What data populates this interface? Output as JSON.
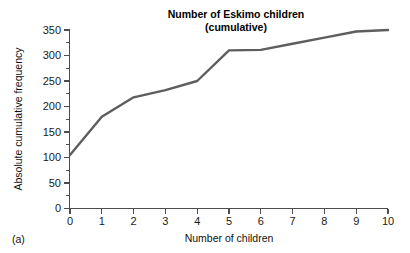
{
  "panel": {
    "label": "(a)"
  },
  "chart_data": {
    "type": "line",
    "title": "Number of Eskimo children",
    "subtitle": "(cumulative)",
    "title_line1": "Number of Eskimo children",
    "title_line2": "(cumulative)",
    "xlabel": "Number of children",
    "ylabel": "Absolute cumulative frequency",
    "x": [
      0,
      1,
      2,
      3,
      4,
      5,
      6,
      7,
      8,
      9,
      10
    ],
    "values": [
      105,
      180,
      218,
      232,
      250,
      310,
      311,
      323,
      335,
      347,
      350
    ],
    "series": [
      {
        "name": "Absolute cumulative frequency",
        "values": [
          105,
          180,
          218,
          232,
          250,
          310,
          311,
          323,
          335,
          347,
          350
        ]
      }
    ],
    "xlim": [
      0,
      10
    ],
    "ylim": [
      0,
      350
    ],
    "xticks": [
      0,
      1,
      2,
      3,
      4,
      5,
      6,
      7,
      8,
      9,
      10
    ],
    "xtick_labels": [
      "0",
      "1",
      "2",
      "3",
      "4",
      "5",
      "6",
      "7",
      "8",
      "9",
      "10"
    ],
    "yticks": [
      0,
      50,
      100,
      150,
      200,
      250,
      300,
      350
    ],
    "ytick_labels": [
      "0",
      "50",
      "100",
      "150",
      "200",
      "250",
      "300",
      "350"
    ],
    "yticks_minor": [
      25,
      75,
      125,
      175,
      225,
      275,
      325
    ],
    "grid": false,
    "legend": false,
    "markers": false,
    "line_color": "#5e5e5e",
    "axis_color": "#4d4d4d",
    "background_color": "#ffffff"
  }
}
